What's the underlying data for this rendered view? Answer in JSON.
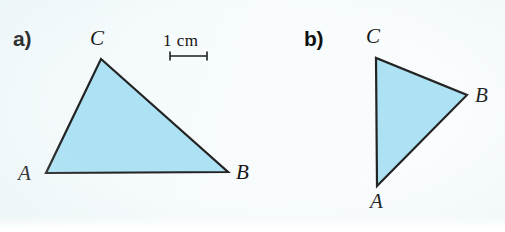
{
  "page": {
    "width": 505,
    "height": 232,
    "background_color": "#f4fafb",
    "grid": {
      "spacing_px": 22.8,
      "origin_x": 1,
      "origin_y": -1,
      "line_color": "#b4cad2",
      "line_width": 1
    }
  },
  "scale_bar": {
    "label": "1 cm",
    "x1": 170,
    "x2": 207,
    "y": 56,
    "tick_height": 9,
    "text_x": 163,
    "text_y": 32,
    "color": "#1d1d1d"
  },
  "figures": [
    {
      "id": "figure-a",
      "part_label": "a)",
      "part_label_x": 13,
      "part_label_y": 28,
      "triangle": {
        "fill_color": "#ace2f4",
        "stroke_color": "#232323",
        "stroke_width": 2.2,
        "vertices": [
          {
            "name": "A",
            "x": 46,
            "y": 173,
            "label_x": 18,
            "label_y": 163
          },
          {
            "name": "B",
            "x": 228,
            "y": 172,
            "label_x": 236,
            "label_y": 162
          },
          {
            "name": "C",
            "x": 101,
            "y": 59,
            "label_x": 90,
            "label_y": 28
          }
        ]
      }
    },
    {
      "id": "figure-b",
      "part_label": "b)",
      "part_label_x": 304,
      "part_label_y": 28,
      "triangle": {
        "fill_color": "#ace2f4",
        "stroke_color": "#232323",
        "stroke_width": 2.2,
        "vertices": [
          {
            "name": "A",
            "x": 377,
            "y": 186,
            "label_x": 370,
            "label_y": 191
          },
          {
            "name": "B",
            "x": 467,
            "y": 95,
            "label_x": 475,
            "label_y": 85
          },
          {
            "name": "C",
            "x": 376,
            "y": 58,
            "label_x": 366,
            "label_y": 26
          }
        ]
      }
    }
  ]
}
